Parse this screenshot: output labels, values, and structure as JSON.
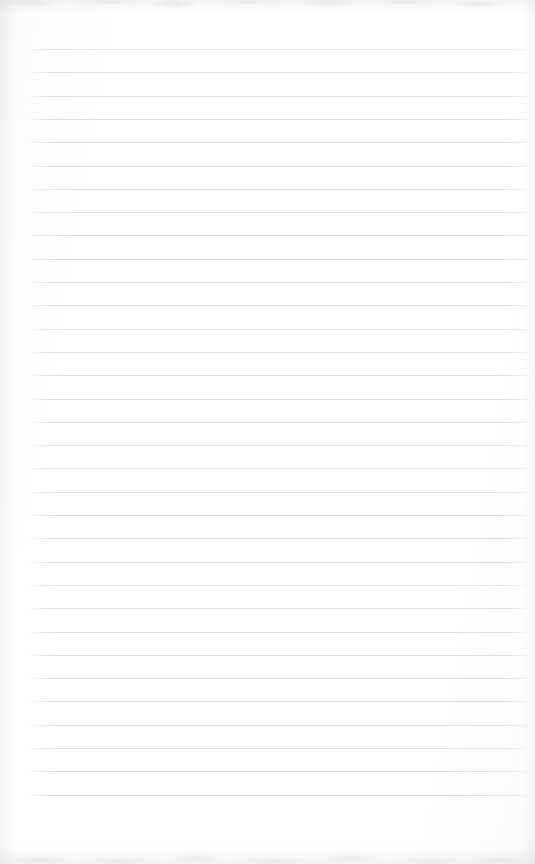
{
  "document": {
    "kind": "scanned-lined-notebook-page",
    "title": "",
    "visible_text": "",
    "body_text": "",
    "page_number": "",
    "annotations": []
  },
  "page": {
    "width_px": 535,
    "height_px": 864,
    "background_color": "#fdfdfd",
    "paper_tone": "#ffffff"
  },
  "ruling": {
    "line_color": "#d9dadd",
    "line_thickness_px": 1,
    "line_spacing_px": 23.3,
    "first_line_y_px": 49,
    "line_count": 33,
    "line_start_x_px": 26,
    "line_end_x_px": 531,
    "top_margin_px": 49,
    "bottom_margin_px": 64,
    "left_margin_px": 26,
    "right_margin_px": 4,
    "vertical_margin_rule": "none"
  },
  "scan_artifacts": {
    "top_edge_noise": "faint grey mottling",
    "bottom_edge_noise": "faint grey mottling",
    "left_edge_shading": "soft vertical grey gradient",
    "right_edge_shading": "very soft vertical grey gradient"
  }
}
